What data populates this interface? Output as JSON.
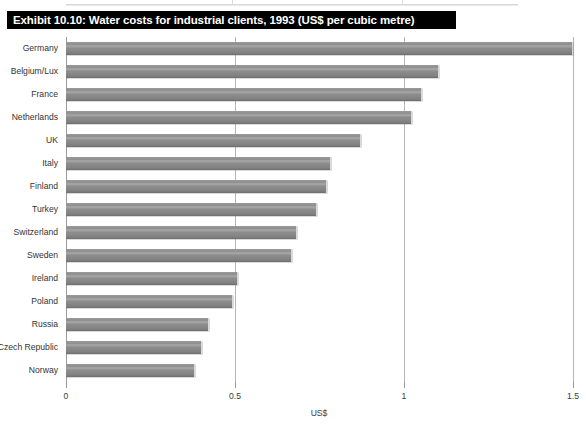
{
  "title": "Exhibit 10.10: Water costs for industrial clients, 1993 (US$ per cubic metre)",
  "chart_data": {
    "type": "bar",
    "orientation": "horizontal",
    "title": "Exhibit 10.10: Water costs for industrial clients, 1993 (US$ per cubic metre)",
    "xlabel": "US$",
    "ylabel": "",
    "xlim": [
      0,
      1.5
    ],
    "xticks": [
      "0",
      "0.5",
      "1",
      "1.5"
    ],
    "xtick_values": [
      0,
      0.5,
      1,
      1.5
    ],
    "grid": true,
    "legend": false,
    "bar_color": "#8c8c8c",
    "categories": [
      "Germany",
      "Belgium/Lux",
      "France",
      "Netherlands",
      "UK",
      "Italy",
      "Finland",
      "Turkey",
      "Switzerland",
      "Sweden",
      "Ireland",
      "Poland",
      "Russia",
      "Czech Republic",
      "Norway"
    ],
    "values": [
      1.5,
      1.1,
      1.05,
      1.02,
      0.87,
      0.78,
      0.77,
      0.74,
      0.68,
      0.665,
      0.505,
      0.49,
      0.42,
      0.4,
      0.38
    ]
  }
}
